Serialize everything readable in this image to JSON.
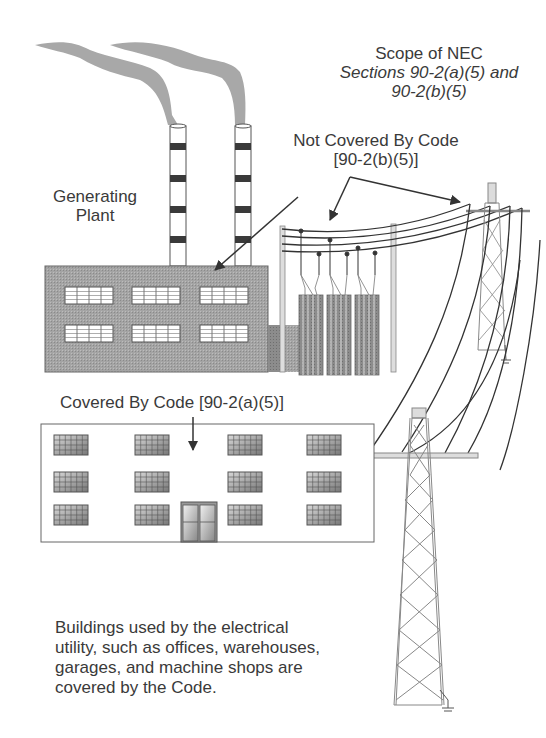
{
  "diagram": {
    "title": {
      "line1": "Scope of NEC",
      "line2": "Sections 90-2(a)(5) and",
      "line3": "90-2(b)(5)"
    },
    "labels": {
      "not_covered_line1": "Not Covered By Code",
      "not_covered_line2": "[90-2(b)(5)]",
      "generating_plant_line1": "Generating",
      "generating_plant_line2": "Plant",
      "covered": "Covered By Code [90-2(a)(5)]"
    },
    "caption": {
      "line1": "Buildings used by the electrical",
      "line2": "utility, such as offices, warehouses,",
      "line3": "garages, and machine shops are",
      "line4": "covered by the Code."
    },
    "elements": {
      "smokestacks": 2,
      "plant_windows": 6,
      "office_windows": 12,
      "transformer_banks": 3,
      "transmission_towers": 2
    },
    "colors": {
      "text": "#3a3a3a",
      "line": "#333333",
      "plant_fill": "#9a9a9a",
      "smoke": "#a8a8a8",
      "stack_band": "#3a3a3a",
      "tower": "#888888"
    }
  }
}
